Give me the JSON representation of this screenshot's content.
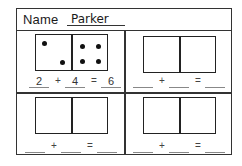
{
  "worksheet": {
    "name_label": "Name",
    "name_value": "Parker",
    "cells": [
      {
        "domino": {
          "left_pips": 2,
          "right_pips": 4
        },
        "equation": {
          "addend1": "2",
          "plus": "+",
          "addend2": "4",
          "equals": "=",
          "sum": "6"
        }
      },
      {
        "domino": {
          "left_pips": 0,
          "right_pips": 0
        },
        "equation": {
          "addend1": "",
          "plus": "+",
          "addend2": "",
          "equals": "=",
          "sum": ""
        }
      },
      {
        "domino": {
          "left_pips": 0,
          "right_pips": 0
        },
        "equation": {
          "addend1": "",
          "plus": "+",
          "addend2": "",
          "equals": "=",
          "sum": ""
        }
      },
      {
        "domino": {
          "left_pips": 0,
          "right_pips": 0
        },
        "equation": {
          "addend1": "",
          "plus": "+",
          "addend2": "",
          "equals": "=",
          "sum": ""
        }
      }
    ]
  },
  "colors": {
    "ink": "#1a1a1a",
    "border": "#333333",
    "background": "#ffffff"
  }
}
